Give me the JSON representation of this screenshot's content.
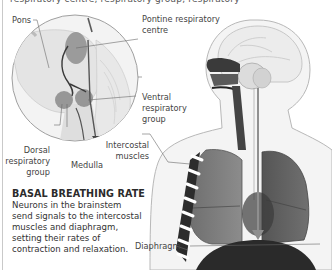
{
  "figure": {
    "top_cut_text": "respiratory centre, respiratory group, respiratory",
    "inset_labels": {
      "pons": "Pons",
      "pontine": "Pontine respiratory\ncentre",
      "pontine_line1": "Pontine respiratory",
      "pontine_line2": "centre",
      "ventral_line1": "Ventral",
      "ventral_line2": "respiratory",
      "ventral_line3": "group",
      "dorsal_line1": "Dorsal",
      "dorsal_line2": "respiratory",
      "dorsal_line3": "group",
      "medulla": "Medulla"
    },
    "body_labels": {
      "intercostal_line1": "Intercostal",
      "intercostal_line2": "muscles",
      "diaphragm": "Diaphragm"
    },
    "caption": {
      "heading": "BASAL BREATHING RATE",
      "text": "Neurons in the brainstem send signals to the intercostal muscles and diaphragm, setting their rates of contraction and relaxation."
    },
    "colors": {
      "background": "#ffffff",
      "region_fill": "#8a8a8a",
      "lung_dark": "#4a4a4a",
      "outline": "#9a9a9a",
      "text": "#3a3a3a"
    }
  }
}
